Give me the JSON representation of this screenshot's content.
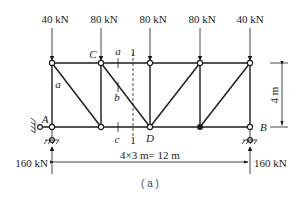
{
  "figure": {
    "caption": "( a )",
    "loads": [
      {
        "label": "40 kN",
        "x": 52
      },
      {
        "label": "80 kN",
        "x": 101
      },
      {
        "label": "80 kN",
        "x": 150
      },
      {
        "label": "80 kN",
        "x": 200
      },
      {
        "label": "40 kN",
        "x": 250
      }
    ],
    "reactions": {
      "left": "160 kN",
      "right": "160 kN"
    },
    "node_labels": {
      "A": "A",
      "B": "B",
      "C": "C",
      "D": "D"
    },
    "member_labels": {
      "a_top": "a",
      "a_diag": "a",
      "b": "b",
      "c": "c"
    },
    "section": {
      "top": "1",
      "bottom": "1"
    },
    "dimensions": {
      "height": "4 m",
      "span": "4×3 m= 12 m"
    }
  }
}
